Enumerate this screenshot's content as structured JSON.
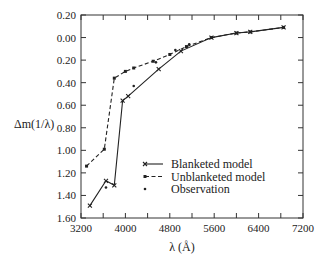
{
  "chart_data": {
    "type": "line",
    "title": "",
    "xlabel": "λ (Å)",
    "ylabel": "Δm(1/λ)",
    "xlim": [
      3200,
      7200
    ],
    "ylim": [
      1.6,
      -0.2
    ],
    "y_inverted": true,
    "x_ticks": [
      3200,
      4000,
      4800,
      5600,
      6400,
      7200
    ],
    "x_tick_labels": [
      "3200",
      "4000",
      "4800",
      "5600",
      "6400",
      "7200"
    ],
    "y_ticks": [
      -0.2,
      0.0,
      0.2,
      0.4,
      0.6,
      0.8,
      1.0,
      1.2,
      1.4,
      1.6
    ],
    "y_tick_labels": [
      "0.20",
      "0.00",
      "0.20",
      "0.40",
      "0.60",
      "0.80",
      "1.00",
      "1.20",
      "1.40",
      "1.60"
    ],
    "grid": false,
    "legend_position": "lower right",
    "series": [
      {
        "name": "Blanketed model",
        "style": "solid",
        "marker": "x",
        "x": [
          3360,
          3650,
          3800,
          3950,
          4050,
          4600,
          5000,
          5550,
          6000,
          6250,
          6850
        ],
        "y": [
          1.49,
          1.27,
          1.31,
          0.56,
          0.52,
          0.28,
          0.12,
          0.0,
          -0.04,
          -0.05,
          -0.09
        ]
      },
      {
        "name": "Unblanketed model",
        "style": "dashed",
        "marker": "square",
        "x": [
          3300,
          3620,
          3800,
          4000,
          4150,
          4500,
          4800,
          5100,
          5550,
          6000,
          6250,
          6850
        ],
        "y": [
          1.14,
          0.99,
          0.36,
          0.3,
          0.27,
          0.21,
          0.15,
          0.08,
          0.0,
          -0.04,
          -0.05,
          -0.09
        ]
      },
      {
        "name": "Observation",
        "style": "none",
        "marker": "dot",
        "x": [
          3650,
          4150,
          4550,
          4900,
          5150
        ],
        "y": [
          1.33,
          0.43,
          0.22,
          0.11,
          0.06
        ]
      }
    ]
  },
  "legend": {
    "items": [
      "Blanketed model",
      "Unblanketed model",
      "Observation"
    ]
  },
  "axes": {
    "xlabel": "λ (Å)",
    "ylabel": "Δm(1/λ)"
  }
}
